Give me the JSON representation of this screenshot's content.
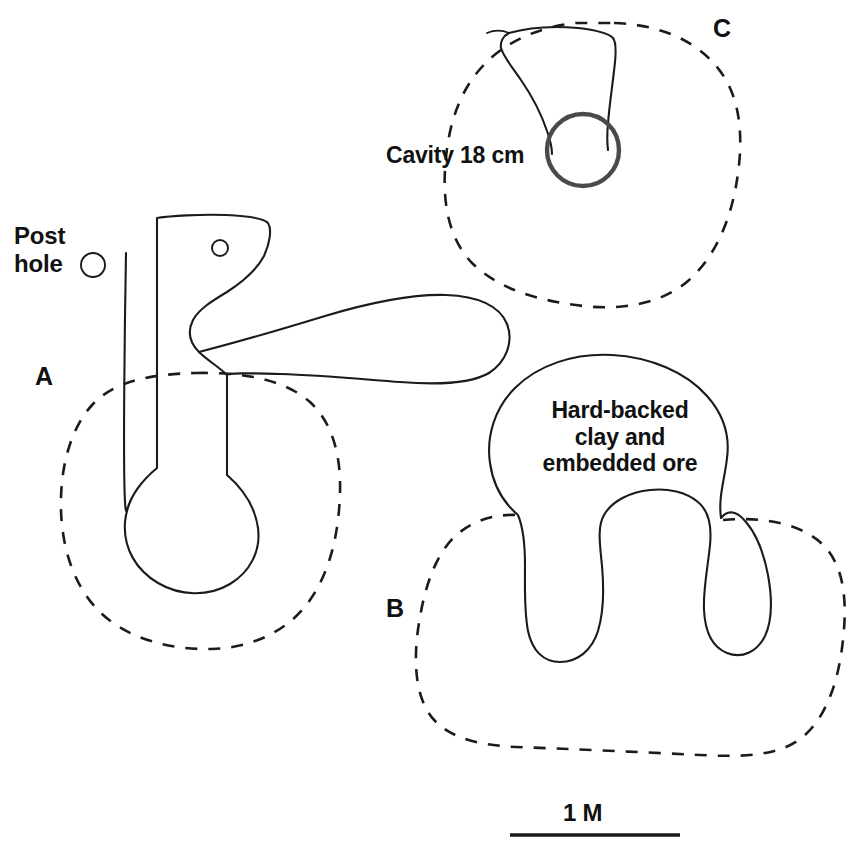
{
  "figure": {
    "kind": "archaeological-site-plan",
    "background_color": "#ffffff",
    "line_color": "#1b1b1b",
    "cavity_ring_color": "#4a4a4a",
    "width": 856,
    "height": 858
  },
  "labels": {
    "post_hole": "Post\nhole",
    "cavity": "Cavity 18 cm",
    "hard_backed": "Hard-backed\nclay and\nembedded ore",
    "feature_a": "A",
    "feature_b": "B",
    "feature_c": "C",
    "scale": "1 M"
  },
  "features": [
    {
      "id": "A",
      "letter": "A",
      "letter_position": {
        "x": 42,
        "y": 380
      },
      "boundary_style": "dashed",
      "contains": [
        "post-hole-circle",
        "furnace-bowl",
        "flue-channel"
      ]
    },
    {
      "id": "B",
      "letter": "B",
      "letter_position": {
        "x": 396,
        "y": 612
      },
      "boundary_style": "dashed",
      "annotation": "Hard-backed clay and embedded ore"
    },
    {
      "id": "C",
      "letter": "C",
      "letter_position": {
        "x": 722,
        "y": 32
      },
      "boundary_style": "dashed",
      "annotation": "Cavity 18 cm"
    }
  ],
  "markers": {
    "post_hole_key_circle": {
      "cx": 93,
      "cy": 265,
      "r": 12
    },
    "small_post_hole": {
      "cx": 220,
      "cy": 248,
      "r": 8
    },
    "cavity_circle": {
      "cx": 583,
      "cy": 150,
      "r": 36,
      "diameter_label": "18 cm"
    }
  },
  "scale_bar": {
    "label": "1 M",
    "x_start": 510,
    "x_end": 680,
    "y": 835,
    "length_px": 170
  }
}
